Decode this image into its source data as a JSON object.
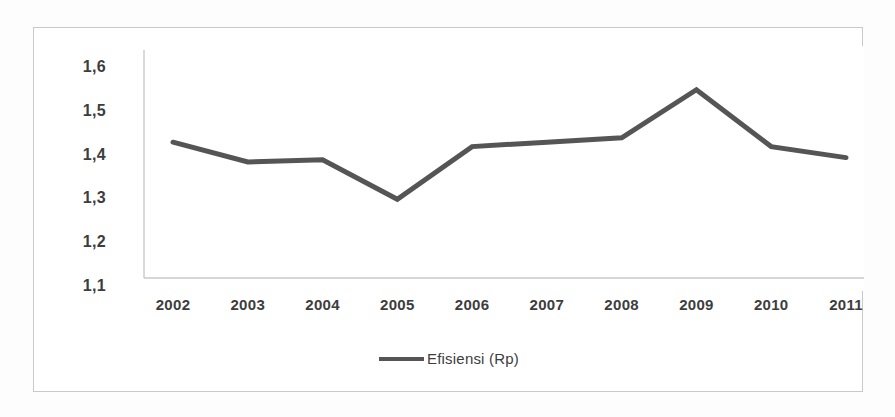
{
  "chart_data": {
    "type": "line",
    "title": "",
    "subtitle": "",
    "xlabel": "",
    "ylabel": "",
    "categories": [
      "2002",
      "2003",
      "2004",
      "2005",
      "2006",
      "2007",
      "2008",
      "2009",
      "2010",
      "2011"
    ],
    "series": [
      {
        "name": "Efisiensi (Rp)",
        "color": "#555555",
        "values": [
          1.41,
          1.365,
          1.37,
          1.28,
          1.4,
          1.41,
          1.42,
          1.53,
          1.4,
          1.375
        ]
      }
    ],
    "ylim": [
      1.1,
      1.6
    ],
    "ytick_labels": [
      "1,6",
      "1,5",
      "1,4",
      "1,3",
      "1,2",
      "1,1"
    ],
    "ytick_values": [
      1.6,
      1.5,
      1.4,
      1.3,
      1.2,
      1.1
    ],
    "xtick_labels": [
      "2002",
      "2003",
      "2004",
      "2005",
      "2006",
      "2007",
      "2008",
      "2009",
      "2010",
      "2011"
    ],
    "grid": false,
    "legend_position": "bottom-center",
    "legend_entries": [
      "Efisiensi (Rp)"
    ],
    "axis_color": "#c9c9c9",
    "decimal_separator": ","
  },
  "frame": {
    "border_color": "#c9c9c9",
    "background": "#ffffff"
  },
  "legend": {
    "label": "Efisiensi (Rp)",
    "swatch_color": "#555555"
  }
}
